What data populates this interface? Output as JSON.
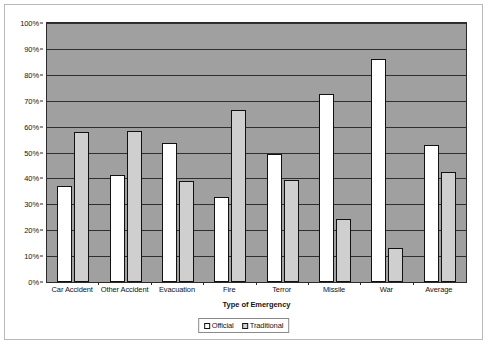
{
  "chart_data": {
    "type": "bar",
    "title": "",
    "xlabel": "Type of Emergency",
    "ylabel": "",
    "ylim": [
      0,
      100
    ],
    "ytick_labels": [
      "100%",
      "90%",
      "80%",
      "70%",
      "60%",
      "50%",
      "40%",
      "30%",
      "20%",
      "10%",
      "0%"
    ],
    "ytick_values": [
      100,
      90,
      80,
      70,
      60,
      50,
      40,
      30,
      20,
      10,
      0
    ],
    "grid": true,
    "legend_position": "bottom-center",
    "categories": [
      "Car Accident",
      "Other Accident",
      "Evacuation",
      "Fire",
      "Terror",
      "Missile",
      "War",
      "Average"
    ],
    "series": [
      {
        "name": "Official",
        "color": "#ffffff",
        "values": [
          37,
          41.5,
          53.5,
          33,
          49.5,
          72.5,
          86,
          53
        ]
      },
      {
        "name": "Traditional",
        "color": "#cfcfcf",
        "values": [
          58,
          58.5,
          39,
          66.5,
          39.5,
          24.5,
          13,
          42.5
        ]
      }
    ]
  },
  "legend": {
    "entries": [
      {
        "label": "Official"
      },
      {
        "label": "Traditional"
      }
    ]
  },
  "colors": {
    "plot_background": "#a0a0a0",
    "bar_official": "#ffffff",
    "bar_traditional": "#cfcfcf",
    "gridline": "#2f2f2f",
    "axis": "#2b2b2b",
    "text": "#141414",
    "frame_border": "#b9b9b9"
  }
}
